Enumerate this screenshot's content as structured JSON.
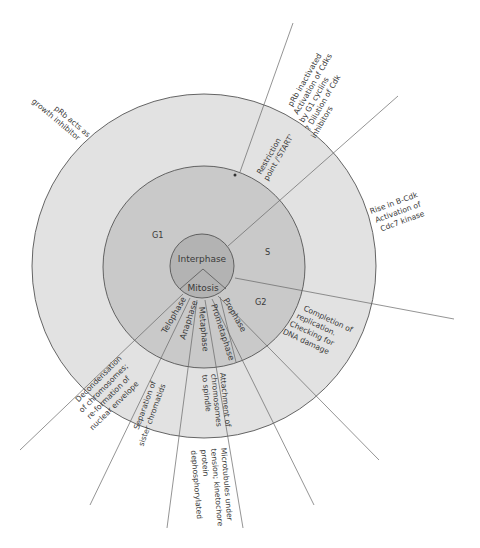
{
  "diagram": {
    "colors": {
      "outer_ring": "#e2e2e2",
      "middle_ring": "#c9c9c9",
      "inner_core": "#b3b3b3",
      "stroke": "#555555",
      "background": "#ffffff"
    },
    "core": {
      "interphase": "Interphase",
      "mitosis": "Mitosis"
    },
    "phases": {
      "g1": "G1",
      "s": "S",
      "g2": "G2",
      "prophase": "Prophase",
      "prometaphase": "Prometaphase",
      "metaphase": "Metaphase",
      "anaphase": "Anaphase",
      "telophase": "Telophase"
    },
    "annotations": {
      "restriction": [
        "Restriction",
        "point /'START'"
      ],
      "prb_growth": [
        "pRb acts as",
        "growth inhibitor"
      ],
      "prb_inactivated": [
        "pRb inactivated",
        "Activation of Cdks",
        "by G1 cyclins",
        "? Dilution of Cdk",
        "inhibitors"
      ],
      "b_cdk": [
        "Rise in B-Cdk",
        "Activation of",
        "Cdc7 kinase"
      ],
      "completion": [
        "Completion of",
        "replication.",
        "Checking for",
        "DNA damage"
      ],
      "attachment": [
        "Attachment of",
        "chromosomes",
        "to spindle"
      ],
      "microtubules": [
        "Microtubules under",
        "tension; kinetochore",
        "protein",
        "dephosphorylated"
      ],
      "separation": [
        "Separation of",
        "sister chromatids"
      ],
      "decondensation": [
        "Decondensation",
        "of chromosomes;",
        "re-formation of",
        "nuclear envelope"
      ]
    }
  }
}
